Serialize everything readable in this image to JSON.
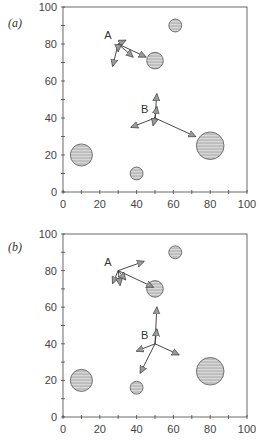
{
  "figure": {
    "panels": [
      {
        "id": "a",
        "label": "(a)",
        "xlim": [
          0,
          100
        ],
        "ylim": [
          0,
          100
        ],
        "xticks": [
          "0",
          "20",
          "40",
          "60",
          "80",
          "100"
        ],
        "yticks": [
          "0",
          "20",
          "40",
          "60",
          "80",
          "100"
        ],
        "circles": [
          {
            "x": 61,
            "y": 90,
            "r": 3.5
          },
          {
            "x": 50,
            "y": 71,
            "r": 4.5
          },
          {
            "x": 80,
            "y": 25,
            "r": 7.5
          },
          {
            "x": 10,
            "y": 20,
            "r": 6
          },
          {
            "x": 40,
            "y": 10,
            "r": 3.5
          }
        ],
        "points": [
          {
            "name": "A",
            "x": 30,
            "y": 80,
            "arrows": [
              [
                34,
                82
              ],
              [
                27,
                68
              ],
              [
                38,
                73
              ],
              [
                45,
                73
              ],
              [
                30,
                76
              ]
            ]
          },
          {
            "name": "B",
            "x": 50,
            "y": 40,
            "arrows": [
              [
                51,
                53
              ],
              [
                51,
                46
              ],
              [
                37,
                35
              ],
              [
                49,
                36
              ],
              [
                72,
                30
              ]
            ]
          }
        ]
      },
      {
        "id": "b",
        "label": "(b)",
        "xlim": [
          0,
          100
        ],
        "ylim": [
          0,
          100
        ],
        "xticks": [
          "0",
          "20",
          "40",
          "60",
          "80",
          "100"
        ],
        "yticks": [
          "0",
          "20",
          "40",
          "60",
          "80",
          "100"
        ],
        "circles": [
          {
            "x": 61,
            "y": 90,
            "r": 3.5
          },
          {
            "x": 50,
            "y": 70,
            "r": 4.5
          },
          {
            "x": 80,
            "y": 25,
            "r": 7.5
          },
          {
            "x": 10,
            "y": 20,
            "r": 6
          },
          {
            "x": 40,
            "y": 16,
            "r": 3.5
          }
        ],
        "points": [
          {
            "name": "A",
            "x": 30,
            "y": 80,
            "arrows": [
              [
                44,
                85
              ],
              [
                49,
                71
              ],
              [
                27,
                73
              ],
              [
                31,
                72
              ],
              [
                34,
                75
              ]
            ]
          },
          {
            "name": "B",
            "x": 50,
            "y": 40,
            "arrows": [
              [
                51,
                60
              ],
              [
                51,
                48
              ],
              [
                40,
                36
              ],
              [
                63,
                34
              ],
              [
                42,
                24
              ]
            ]
          }
        ]
      }
    ]
  }
}
